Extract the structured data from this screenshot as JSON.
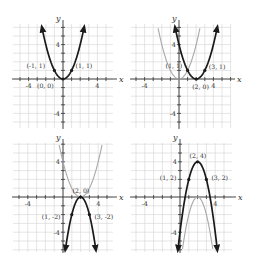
{
  "chart_data": [
    {
      "type": "line",
      "panel": "top-left",
      "title": "",
      "xlabel": "x",
      "ylabel": "y",
      "xlim": [
        -6,
        6
      ],
      "ylim": [
        -6,
        6
      ],
      "grid": true,
      "x_ticks": [
        "-4",
        "4"
      ],
      "y_ticks": [
        "4",
        "-4"
      ],
      "series": [
        {
          "name": "y = x^2",
          "style": "dark",
          "equation": {
            "a": 1,
            "h": 0,
            "k": 0
          }
        }
      ],
      "points": [
        {
          "x": -1,
          "y": 1,
          "label": "(-1, 1)"
        },
        {
          "x": 1,
          "y": 1,
          "label": "(1, 1)"
        },
        {
          "x": 0,
          "y": 0,
          "label": "(0, 0)"
        }
      ]
    },
    {
      "type": "line",
      "panel": "top-right",
      "title": "",
      "xlabel": "x",
      "ylabel": "y",
      "xlim": [
        -6,
        6
      ],
      "ylim": [
        -6,
        6
      ],
      "grid": true,
      "x_ticks": [
        "-4",
        "4"
      ],
      "y_ticks": [
        "4",
        "-4"
      ],
      "series": [
        {
          "name": "y = x^2",
          "style": "light",
          "equation": {
            "a": 1,
            "h": 0,
            "k": 0
          }
        },
        {
          "name": "y = (x-2)^2",
          "style": "dark",
          "equation": {
            "a": 1,
            "h": 2,
            "k": 0
          }
        }
      ],
      "points": [
        {
          "x": 1,
          "y": 1,
          "label": "(1, 1)"
        },
        {
          "x": 3,
          "y": 1,
          "label": "(3, 1)"
        },
        {
          "x": 2,
          "y": 0,
          "label": "(2, 0)"
        }
      ]
    },
    {
      "type": "line",
      "panel": "bottom-left",
      "title": "",
      "xlabel": "x",
      "ylabel": "y",
      "xlim": [
        -6,
        6
      ],
      "ylim": [
        -6,
        6
      ],
      "grid": true,
      "x_ticks": [
        "-4",
        "4"
      ],
      "y_ticks": [
        "4",
        "-4"
      ],
      "series": [
        {
          "name": "y = (x-2)^2",
          "style": "light",
          "equation": {
            "a": 1,
            "h": 2,
            "k": 0
          }
        },
        {
          "name": "y = -2(x-2)^2",
          "style": "dark",
          "equation": {
            "a": -2,
            "h": 2,
            "k": 0
          }
        }
      ],
      "points": [
        {
          "x": 2,
          "y": 0,
          "label": "(2, 0)"
        },
        {
          "x": 1,
          "y": -2,
          "label": "(1, -2)"
        },
        {
          "x": 3,
          "y": -2,
          "label": "(3, -2)"
        }
      ]
    },
    {
      "type": "line",
      "panel": "bottom-right",
      "title": "",
      "xlabel": "x",
      "ylabel": "y",
      "xlim": [
        -6,
        6
      ],
      "ylim": [
        -6,
        6
      ],
      "grid": true,
      "x_ticks": [
        "-4",
        "4"
      ],
      "y_ticks": [
        "4",
        "-4"
      ],
      "series": [
        {
          "name": "y = -2(x-2)^2",
          "style": "light",
          "equation": {
            "a": -2,
            "h": 2,
            "k": 0
          }
        },
        {
          "name": "y = -2(x-2)^2 + 4",
          "style": "dark",
          "equation": {
            "a": -2,
            "h": 2,
            "k": 4
          }
        }
      ],
      "points": [
        {
          "x": 2,
          "y": 4,
          "label": "(2, 4)"
        },
        {
          "x": 1,
          "y": 2,
          "label": "(1, 2)"
        },
        {
          "x": 3,
          "y": 2,
          "label": "(3, 2)"
        }
      ]
    }
  ],
  "colors": {
    "dark_curve": "#1a1a1a",
    "light_curve": "#a8a8a8",
    "grid": "#d4d4d4",
    "axis": "#333333",
    "label": "#333333"
  }
}
